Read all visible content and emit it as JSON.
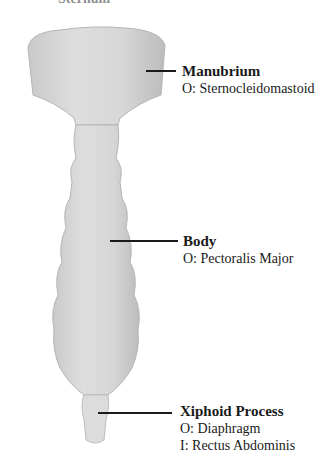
{
  "diagram": {
    "title": "Sternum",
    "parts": [
      {
        "name": "Manubrium",
        "attachments": [
          "O: Sternocleidomastoid"
        ]
      },
      {
        "name": "Body",
        "attachments": [
          "O: Pectoralis Major"
        ]
      },
      {
        "name": "Xiphoid Process",
        "attachments": [
          "O: Diaphragm",
          "I: Rectus Abdominis"
        ]
      }
    ],
    "colors": {
      "bone": "#d9d9d9",
      "bone_shadow": "#bdbdbd",
      "line": "#1a1a1a"
    }
  }
}
